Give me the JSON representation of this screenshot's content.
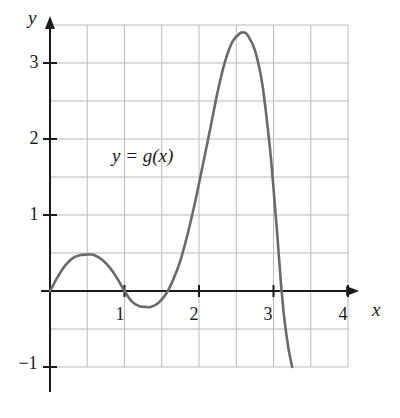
{
  "figure": {
    "name": "graph-of-y-equals-g-of-x",
    "background_color": "#ffffff"
  },
  "labels": {
    "y_axis": "y",
    "x_axis": "x",
    "curve": "y = g(x)"
  },
  "ticks": {
    "y": [
      "3",
      "2",
      "1",
      "−1"
    ],
    "x": [
      "1",
      "2",
      "3",
      "4"
    ]
  },
  "colors": {
    "curve": "#6a6a6a",
    "axis": "#1a1a1a",
    "grid": "#b9b9b9",
    "text": "#1a1a1a"
  },
  "chart_data": {
    "type": "line",
    "title": "",
    "xlabel": "x",
    "ylabel": "y",
    "series": [
      {
        "name": "y = g(x)",
        "color": "#6a6a6a",
        "x": [
          0.0,
          0.1,
          0.2,
          0.3,
          0.4,
          0.5,
          0.55,
          0.6,
          0.7,
          0.8,
          0.9,
          1.0,
          1.1,
          1.2,
          1.3,
          1.35,
          1.45,
          1.55,
          1.65,
          1.75,
          1.85,
          1.95,
          2.05,
          2.15,
          2.25,
          2.35,
          2.45,
          2.55,
          2.6,
          2.65,
          2.75,
          2.85,
          2.95,
          3.0,
          3.05,
          3.1,
          3.15,
          3.2,
          3.25
        ],
        "y": [
          0.0,
          0.18,
          0.33,
          0.43,
          0.47,
          0.48,
          0.48,
          0.47,
          0.41,
          0.31,
          0.17,
          0.0,
          -0.14,
          -0.2,
          -0.21,
          -0.21,
          -0.16,
          -0.05,
          0.14,
          0.4,
          0.76,
          1.18,
          1.65,
          2.13,
          2.62,
          3.02,
          3.28,
          3.39,
          3.4,
          3.37,
          3.17,
          2.72,
          1.9,
          1.35,
          0.75,
          0.1,
          -0.4,
          -0.75,
          -1.0
        ]
      }
    ],
    "xlim": [
      -0.12,
      4.15
    ],
    "ylim": [
      -1.33,
      3.62
    ],
    "xticks": [
      1,
      2,
      3,
      4
    ],
    "yticks": [
      -1,
      1,
      2,
      3
    ],
    "grid": true,
    "grid_x_range": [
      0,
      4
    ],
    "grid_y_range": [
      -1,
      3.5
    ],
    "grid_step": 0.5,
    "legend": "none",
    "annotations": [
      {
        "text": "y = g(x)",
        "x": 0.9,
        "y": 1.72
      }
    ],
    "features": {
      "local_max_1": {
        "x": 0.55,
        "y": 0.48
      },
      "local_min_1": {
        "x": 1.3,
        "y": -0.21
      },
      "global_max": {
        "x": 2.6,
        "y": 3.4
      },
      "zero_crossings": [
        0.0,
        1.0,
        1.6,
        3.11
      ],
      "curve_end": {
        "x": 3.25,
        "y": -1.0
      }
    }
  }
}
